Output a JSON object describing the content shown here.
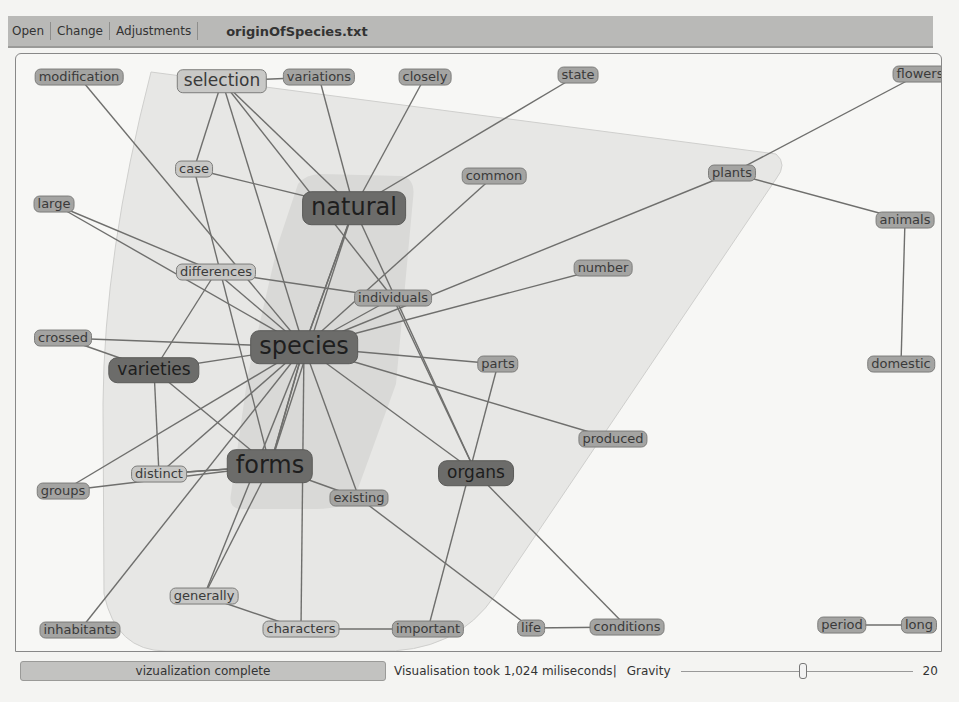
{
  "toolbar": {
    "menu": [
      "Open",
      "Change",
      "Adjustments"
    ],
    "file_title": "originOfSpecies.txt"
  },
  "graph": {
    "hull_color": "#e6e6e4",
    "inner_hull_color": "#d8d8d6",
    "edge_color": "#6f6f6d",
    "nodes": [
      {
        "id": "modification",
        "label": "modification",
        "x": 63,
        "y": 23,
        "style": "level-0"
      },
      {
        "id": "selection",
        "label": "selection",
        "x": 206,
        "y": 27,
        "style": "level-2"
      },
      {
        "id": "variations",
        "label": "variations",
        "x": 303,
        "y": 23,
        "style": "level-0"
      },
      {
        "id": "closely",
        "label": "closely",
        "x": 409,
        "y": 23,
        "style": "level-0"
      },
      {
        "id": "state",
        "label": "state",
        "x": 562,
        "y": 21,
        "style": "level-0"
      },
      {
        "id": "flowers",
        "label": "flowers",
        "x": 904,
        "y": 20,
        "style": "level-0"
      },
      {
        "id": "case",
        "label": "case",
        "x": 178,
        "y": 115,
        "style": "level-1"
      },
      {
        "id": "natural",
        "label": "natural",
        "x": 338,
        "y": 154,
        "style": "big",
        "size": "size-xl"
      },
      {
        "id": "common",
        "label": "common",
        "x": 478,
        "y": 122,
        "style": "level-0"
      },
      {
        "id": "plants",
        "label": "plants",
        "x": 716,
        "y": 119,
        "style": "level-0"
      },
      {
        "id": "large",
        "label": "large",
        "x": 38,
        "y": 150,
        "style": "level-0"
      },
      {
        "id": "animals",
        "label": "animals",
        "x": 889,
        "y": 166,
        "style": "level-0"
      },
      {
        "id": "differences",
        "label": "differences",
        "x": 200,
        "y": 218,
        "style": "level-1"
      },
      {
        "id": "number",
        "label": "number",
        "x": 587,
        "y": 214,
        "style": "level-0"
      },
      {
        "id": "individuals",
        "label": "individuals",
        "x": 377,
        "y": 244,
        "style": "level-0"
      },
      {
        "id": "crossed",
        "label": "crossed",
        "x": 47,
        "y": 284,
        "style": "level-0"
      },
      {
        "id": "species",
        "label": "species",
        "x": 288,
        "y": 293,
        "style": "big",
        "size": "size-xl"
      },
      {
        "id": "varieties",
        "label": "varieties",
        "x": 138,
        "y": 316,
        "style": "big",
        "size": "size-l"
      },
      {
        "id": "parts",
        "label": "parts",
        "x": 482,
        "y": 310,
        "style": "level-0"
      },
      {
        "id": "domestic",
        "label": "domestic",
        "x": 885,
        "y": 310,
        "style": "level-0"
      },
      {
        "id": "produced",
        "label": "produced",
        "x": 597,
        "y": 385,
        "style": "level-0"
      },
      {
        "id": "forms",
        "label": "forms",
        "x": 254,
        "y": 412,
        "style": "big",
        "size": "size-xl"
      },
      {
        "id": "organs",
        "label": "organs",
        "x": 460,
        "y": 419,
        "style": "big",
        "size": "size-l"
      },
      {
        "id": "distinct",
        "label": "distinct",
        "x": 143,
        "y": 420,
        "style": "level-1"
      },
      {
        "id": "groups",
        "label": "groups",
        "x": 47,
        "y": 437,
        "style": "level-0"
      },
      {
        "id": "existing",
        "label": "existing",
        "x": 343,
        "y": 444,
        "style": "level-0"
      },
      {
        "id": "generally",
        "label": "generally",
        "x": 188,
        "y": 542,
        "style": "level-1"
      },
      {
        "id": "inhabitants",
        "label": "inhabitants",
        "x": 64,
        "y": 576,
        "style": "level-0"
      },
      {
        "id": "characters",
        "label": "characters",
        "x": 285,
        "y": 575,
        "style": "level-1"
      },
      {
        "id": "important",
        "label": "important",
        "x": 412,
        "y": 575,
        "style": "level-0"
      },
      {
        "id": "life",
        "label": "life",
        "x": 515,
        "y": 574,
        "style": "level-0"
      },
      {
        "id": "conditions",
        "label": "conditions",
        "x": 611,
        "y": 573,
        "style": "level-0"
      },
      {
        "id": "period",
        "label": "period",
        "x": 826,
        "y": 571,
        "style": "level-0"
      },
      {
        "id": "long",
        "label": "long",
        "x": 903,
        "y": 571,
        "style": "level-0"
      }
    ],
    "edges": [
      [
        "selection",
        "variations"
      ],
      [
        "selection",
        "case"
      ],
      [
        "selection",
        "natural"
      ],
      [
        "selection",
        "species"
      ],
      [
        "selection",
        "individuals"
      ],
      [
        "modification",
        "species"
      ],
      [
        "variations",
        "natural"
      ],
      [
        "closely",
        "natural"
      ],
      [
        "state",
        "natural"
      ],
      [
        "case",
        "natural"
      ],
      [
        "case",
        "forms"
      ],
      [
        "common",
        "species"
      ],
      [
        "flowers",
        "plants"
      ],
      [
        "plants",
        "animals"
      ],
      [
        "plants",
        "species"
      ],
      [
        "animals",
        "domestic"
      ],
      [
        "large",
        "species"
      ],
      [
        "natural",
        "species"
      ],
      [
        "natural",
        "forms"
      ],
      [
        "natural",
        "organs"
      ],
      [
        "natural",
        "species"
      ],
      [
        "differences",
        "species"
      ],
      [
        "differences",
        "individuals"
      ],
      [
        "differences",
        "varieties"
      ],
      [
        "differences",
        "large"
      ],
      [
        "number",
        "species"
      ],
      [
        "individuals",
        "species"
      ],
      [
        "individuals",
        "organs"
      ],
      [
        "crossed",
        "species"
      ],
      [
        "crossed",
        "varieties"
      ],
      [
        "varieties",
        "species"
      ],
      [
        "varieties",
        "distinct"
      ],
      [
        "varieties",
        "forms"
      ],
      [
        "species",
        "parts"
      ],
      [
        "species",
        "produced"
      ],
      [
        "species",
        "forms"
      ],
      [
        "species",
        "forms"
      ],
      [
        "species",
        "groups"
      ],
      [
        "species",
        "distinct"
      ],
      [
        "species",
        "inhabitants"
      ],
      [
        "species",
        "existing"
      ],
      [
        "species",
        "organs"
      ],
      [
        "species",
        "generally"
      ],
      [
        "species",
        "characters"
      ],
      [
        "parts",
        "important"
      ],
      [
        "forms",
        "distinct"
      ],
      [
        "forms",
        "distinct"
      ],
      [
        "forms",
        "groups"
      ],
      [
        "forms",
        "existing"
      ],
      [
        "forms",
        "generally"
      ],
      [
        "organs",
        "conditions"
      ],
      [
        "existing",
        "life"
      ],
      [
        "generally",
        "characters"
      ],
      [
        "characters",
        "important"
      ],
      [
        "life",
        "conditions"
      ],
      [
        "period",
        "long"
      ]
    ]
  },
  "status_bar": {
    "progress_label": "vizualization complete",
    "timing_text": "Visualisation took 1,024 miliseconds|",
    "gravity_label": "Gravity",
    "gravity_value": "20"
  }
}
